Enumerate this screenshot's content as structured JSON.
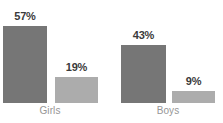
{
  "chart_data": {
    "type": "bar",
    "title": "",
    "subtitle": "",
    "xlabel": "",
    "ylabel": "",
    "categories": [
      "Girls",
      "Boys"
    ],
    "series": [
      {
        "name": "series-1",
        "values": [
          57,
          19
        ],
        "color": "#767676"
      },
      {
        "name": "series-2",
        "values": [
          43,
          9
        ],
        "color": "#acacac"
      }
    ],
    "value_labels": [
      "57%",
      "19%",
      "43%",
      "9%"
    ],
    "ylim": [
      0,
      60
    ],
    "grid": false,
    "legend": "none",
    "axis_visible": false,
    "unit": "%"
  },
  "groups": [
    {
      "category": "Girls",
      "bars": [
        {
          "label": "57%",
          "value": 57,
          "color": "#767676",
          "tone": "dark"
        },
        {
          "label": "19%",
          "value": 19,
          "color": "#acacac",
          "tone": "light"
        }
      ]
    },
    {
      "category": "Boys",
      "bars": [
        {
          "label": "43%",
          "value": 43,
          "color": "#767676",
          "tone": "dark"
        },
        {
          "label": "9%",
          "value": 9,
          "color": "#acacac",
          "tone": "light"
        }
      ]
    }
  ],
  "style": {
    "background": "#ffffff",
    "dark_bar_color": "#767676",
    "light_bar_color": "#acacac",
    "value_label_color": "#3a3a3a",
    "category_label_color": "#969696"
  }
}
